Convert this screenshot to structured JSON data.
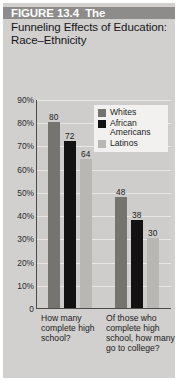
{
  "figure": {
    "number_label": "FIGURE 13.4",
    "title_line1_tail": "The",
    "title_rest": "Funneling Effects of Education: Race–Ethnicity",
    "background_color": "#d2d0ce",
    "banner_color": "#8e8c8a"
  },
  "legend": {
    "items": [
      {
        "label": "Whites",
        "color": "#76746f"
      },
      {
        "label": "African Americans",
        "color": "#121212"
      },
      {
        "label": "Latinos",
        "color": "#b9b7b3"
      }
    ]
  },
  "chart_data": {
    "type": "bar",
    "xlabel": "",
    "ylabel": "",
    "ylim": [
      0,
      90
    ],
    "grid": true,
    "legend_position": "top-right",
    "categories": [
      "How many complete high school?",
      "Of those who complete high school, how many go to college?"
    ],
    "ytick_labels": [
      "90%",
      "80%",
      "70%",
      "60%",
      "50%",
      "40%",
      "30%",
      "20%",
      "10%",
      "0"
    ],
    "ytick_values": [
      90,
      80,
      70,
      60,
      50,
      40,
      30,
      20,
      10,
      0
    ],
    "series": [
      {
        "name": "Whites",
        "color": "#76746f",
        "values": [
          80,
          48
        ]
      },
      {
        "name": "African Americans",
        "color": "#121212",
        "values": [
          72,
          38
        ]
      },
      {
        "name": "Latinos",
        "color": "#b9b7b3",
        "values": [
          64,
          30
        ]
      }
    ]
  }
}
